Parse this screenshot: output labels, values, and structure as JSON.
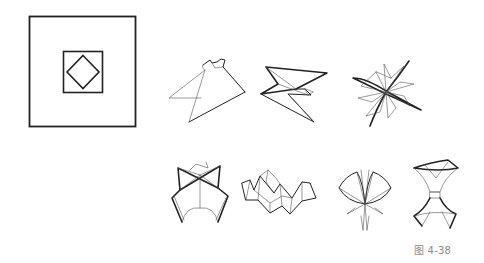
{
  "page": {
    "background": "#ffffff",
    "line_color": "#222222"
  },
  "diagram": {
    "pattern": {
      "name": "square-in-square-with-diamond",
      "outer_square": {
        "x": 29,
        "y": 16,
        "w": 107,
        "h": 111
      },
      "inner_square": {
        "x": 63,
        "y": 51,
        "w": 40,
        "h": 42
      },
      "diamond_center": [
        83,
        72
      ]
    },
    "folded_forms_row1": [
      {
        "id": 1,
        "name": "folded-form-1",
        "description": "triangular flap fold"
      },
      {
        "id": 2,
        "name": "folded-form-2",
        "description": "arrowhead fold"
      },
      {
        "id": 3,
        "name": "folded-form-3",
        "description": "star pinwheel fold"
      }
    ],
    "folded_forms_row2": [
      {
        "id": 4,
        "name": "folded-form-4",
        "description": "vase-like fold"
      },
      {
        "id": 5,
        "name": "folded-form-5",
        "description": "wavy ridge fold"
      },
      {
        "id": 6,
        "name": "folded-form-6",
        "description": "flower petal fold"
      },
      {
        "id": 7,
        "name": "folded-form-7",
        "description": "hourglass fold"
      }
    ]
  },
  "caption": {
    "text": "图 4-38",
    "color": "#8a8a8a"
  }
}
